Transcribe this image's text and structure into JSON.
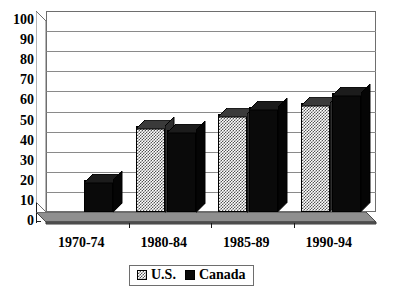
{
  "chart_data": {
    "type": "bar",
    "title": "",
    "subtitle": "",
    "xlabel": "",
    "ylabel": "",
    "categories": [
      "1970-74",
      "1980-84",
      "1985-89",
      "1990-94"
    ],
    "series": [
      {
        "name": "U.S.",
        "values": [
          null,
          43,
          49,
          54
        ],
        "fill": "checkerboard",
        "color": "#555555"
      },
      {
        "name": "Canada",
        "values": [
          16,
          41,
          52,
          59
        ],
        "fill": "solid",
        "color": "#0a0a0a"
      }
    ],
    "ylim": [
      0,
      100
    ],
    "ytick_step": 10,
    "ytick_labels": [
      "0",
      "10",
      "20",
      "30",
      "40",
      "50",
      "60",
      "70",
      "80",
      "90",
      "100"
    ],
    "grid": "horizontal",
    "legend_position": "bottom",
    "style": "3d-column",
    "legend": [
      {
        "label": "U.S.",
        "swatch": "checkerboard-swatch"
      },
      {
        "label": "Canada",
        "swatch": "solid-black-swatch"
      }
    ]
  },
  "colors": {
    "gridline": "#8a8a8a",
    "axis": "#1a1a1a",
    "plot_border": "#6e6e6e",
    "floor": "#6b6b6b",
    "floor_top": "#8f8f8f",
    "background": "#ffffff"
  }
}
